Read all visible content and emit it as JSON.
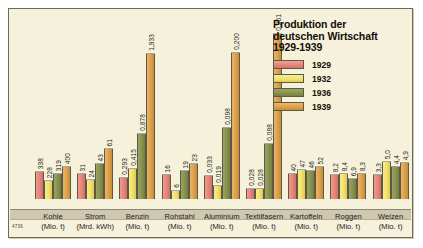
{
  "chart_data": {
    "type": "bar",
    "title_lines": [
      "Produktion der",
      "deutschen Wirtschaft",
      "1929-1939"
    ],
    "xlabel": "",
    "ylabel": "",
    "grid": false,
    "legend_position": "top-right",
    "legend": [
      "1929",
      "1932",
      "1936",
      "1939"
    ],
    "series": [
      {
        "name": "1929",
        "color": "#e4837a",
        "values": [
          338,
          31,
          0.293,
          16,
          0.033,
          0.028,
          40,
          8.2,
          3.3
        ]
      },
      {
        "name": "1932",
        "color": "#f2e06a",
        "values": [
          228,
          24,
          0.415,
          6,
          0.019,
          0.028,
          47,
          8.4,
          5.0
        ]
      },
      {
        "name": "1936",
        "color": "#87924f",
        "values": [
          319,
          43,
          0.878,
          19,
          0.098,
          0.088,
          46,
          6.9,
          4.4
        ]
      },
      {
        "name": "1939",
        "color": "#dca04a",
        "values": [
          400,
          61,
          1.933,
          23,
          0.2,
          0.261,
          52,
          8.3,
          4.9
        ]
      }
    ],
    "categories": [
      {
        "name": "Kohle",
        "unit": "(Mio. t)",
        "labels": [
          "338",
          "228",
          "319",
          "400"
        ],
        "heights": [
          28,
          19,
          26,
          33
        ]
      },
      {
        "name": "Strom",
        "unit": "(Mrd. kWh)",
        "labels": [
          "31",
          "24",
          "43",
          "61"
        ],
        "heights": [
          26,
          20,
          36,
          51
        ]
      },
      {
        "name": "Benzin",
        "unit": "(Mio. t)",
        "labels": [
          "0,293",
          "0,415",
          "0,878",
          "1,933"
        ],
        "heights": [
          22,
          31,
          66,
          146
        ]
      },
      {
        "name": "Rohstahl",
        "unit": "(Mio. t)",
        "labels": [
          "16",
          "6",
          "19",
          "23"
        ],
        "heights": [
          25,
          9,
          29,
          36
        ]
      },
      {
        "name": "Aluminium",
        "unit": "(Mio. t)",
        "labels": [
          "0,033",
          "0,019",
          "0,098",
          "0,200"
        ],
        "heights": [
          24,
          14,
          72,
          147
        ]
      },
      {
        "name": "Textilfasern",
        "unit": "(Mio. t)",
        "labels": [
          "0,028",
          "0,028",
          "0,088",
          "0,261"
        ],
        "heights": [
          11,
          11,
          56,
          166
        ]
      },
      {
        "name": "Kartoffeln",
        "unit": "(Mio. t)",
        "labels": [
          "40",
          "47",
          "46",
          "52"
        ],
        "heights": [
          26,
          30,
          29,
          33
        ]
      },
      {
        "name": "Roggen",
        "unit": "(Mio. t)",
        "labels": [
          "8,2",
          "8,4",
          "6,9",
          "8,3"
        ],
        "heights": [
          25,
          26,
          21,
          26
        ]
      },
      {
        "name": "Weizen",
        "unit": "(Mio. t)",
        "labels": [
          "3,3",
          "5,0",
          "4,4",
          "4,9"
        ],
        "heights": [
          25,
          38,
          33,
          37
        ]
      }
    ]
  },
  "corner_code": "4736"
}
